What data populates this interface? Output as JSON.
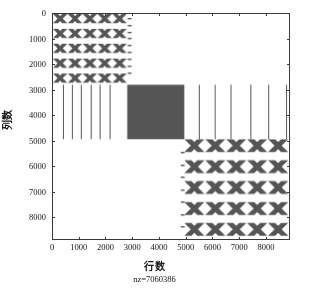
{
  "figure": {
    "type": "spy-plot",
    "background": "#ffffff",
    "frame_color": "#3a3a3a"
  },
  "axes": {
    "x_title": "行数",
    "y_title": "列数",
    "x_ticks": [
      "0",
      "1000",
      "2000",
      "3000",
      "4000",
      "5000",
      "6000",
      "7000",
      "8000"
    ],
    "y_ticks": [
      "0",
      "1000",
      "2000",
      "3000",
      "4000",
      "5000",
      "6000",
      "7000",
      "8000"
    ]
  },
  "footer": {
    "nz_text": "nz=7060386"
  },
  "chart_data": {
    "type": "scatter",
    "subtype": "matrix-sparsity-pattern",
    "title": "",
    "xlabel": "行数",
    "ylabel": "列数",
    "annotation": "nz=7060386",
    "nonzeros": 7060386,
    "xlim": [
      0,
      8900
    ],
    "ylim": [
      0,
      8900
    ],
    "y_inverted": true,
    "grid": false,
    "legend": null,
    "xtick_values": [
      0,
      1000,
      2000,
      3000,
      4000,
      5000,
      6000,
      7000,
      8000
    ],
    "ytick_values": [
      0,
      1000,
      2000,
      3000,
      4000,
      5000,
      6000,
      7000,
      8000
    ],
    "marker_color": "#555555",
    "blocks": [
      {
        "name": "upper-left-banded-block",
        "kind": "diagonal-lattice",
        "x_range": [
          0,
          2800
        ],
        "y_range": [
          0,
          2800
        ],
        "band_count": 5,
        "band_spacing": 560,
        "density": "medium"
      },
      {
        "name": "upper-dashes-column",
        "kind": "dash-column",
        "x_range": [
          2820,
          2960
        ],
        "y_range": [
          150,
          2300
        ],
        "dash_count": 9,
        "density": "sparse"
      },
      {
        "name": "center-dense-block",
        "kind": "solid",
        "x_range": [
          2800,
          4950
        ],
        "y_range": [
          2800,
          4950
        ],
        "density": "full"
      },
      {
        "name": "left-vertical-lines",
        "kind": "vertical-lines",
        "x_values": [
          370,
          720,
          1060,
          1420,
          1770,
          2120
        ],
        "y_range": [
          2800,
          4950
        ],
        "density": "sparse"
      },
      {
        "name": "right-vertical-lines",
        "kind": "vertical-lines",
        "x_values": [
          5500,
          6100,
          6700,
          7450,
          8100,
          8800
        ],
        "y_range": [
          2800,
          4950
        ],
        "density": "sparse"
      },
      {
        "name": "lower-right-banded-block",
        "kind": "diagonal-lattice",
        "x_range": [
          4950,
          8900
        ],
        "y_range": [
          4950,
          8900
        ],
        "band_count": 5,
        "band_spacing": 790,
        "density": "medium"
      },
      {
        "name": "lower-dashes-column",
        "kind": "dash-column",
        "x_range": [
          4820,
          4960
        ],
        "y_range": [
          5450,
          8400
        ],
        "dash_count": 7,
        "density": "sparse"
      }
    ]
  }
}
